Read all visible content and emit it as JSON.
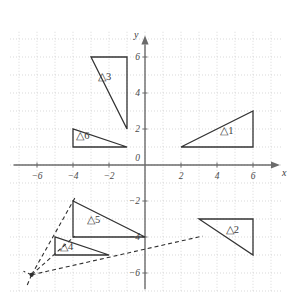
{
  "figure": {
    "background_color": "#ffffff",
    "width": 295,
    "height": 298
  },
  "axes": {
    "x_axis_label": "x",
    "y_axis_label": "y",
    "origin_label": "0",
    "axis_color": "#6b6b6b",
    "grid_color": "#c9c9c9",
    "grid_visible": true,
    "grid_style": "dotted",
    "grid_step": 1,
    "unit_px": 18,
    "origin_px": {
      "x": 145,
      "y": 165
    },
    "xlim": [
      -7.5,
      7.6
    ],
    "ylim": [
      -7.0,
      7.4
    ],
    "x_ticks": [
      {
        "value": -6,
        "label": "−6"
      },
      {
        "value": -4,
        "label": "−4"
      },
      {
        "value": -2,
        "label": "−2"
      },
      {
        "value": 2,
        "label": "2"
      },
      {
        "value": 4,
        "label": "4"
      },
      {
        "value": 6,
        "label": "6"
      }
    ],
    "y_ticks": [
      {
        "value": 6,
        "label": "6"
      },
      {
        "value": 4,
        "label": "4"
      },
      {
        "value": 2,
        "label": "2"
      },
      {
        "value": -2,
        "label": "−2"
      },
      {
        "value": -4,
        "label": "−4"
      },
      {
        "value": -6,
        "label": "−6"
      }
    ]
  },
  "shape_style": {
    "stroke_color": "#333333",
    "stroke_width": 1.3,
    "fill": "none",
    "dashed_stroke_color": "#2f2f2f",
    "dashed_stroke_width": 1.1,
    "dash_pattern": "4,3"
  },
  "triangles": [
    {
      "id": "triangle-1",
      "label": "△1",
      "vertices": [
        [
          2,
          1
        ],
        [
          6,
          1
        ],
        [
          6,
          3
        ]
      ],
      "label_pos": [
        4.55,
        1.75
      ]
    },
    {
      "id": "triangle-2",
      "label": "△2",
      "vertices": [
        [
          3,
          -3
        ],
        [
          6,
          -3
        ],
        [
          6,
          -5
        ]
      ],
      "label_pos": [
        4.85,
        -3.75
      ]
    },
    {
      "id": "triangle-3",
      "label": "△3",
      "vertices": [
        [
          -3,
          6
        ],
        [
          -1,
          6
        ],
        [
          -1,
          2
        ]
      ],
      "label_pos": [
        -2.25,
        4.75
      ]
    },
    {
      "id": "triangle-4",
      "label": "△4",
      "vertices": [
        [
          -5,
          -4
        ],
        [
          -5,
          -5
        ],
        [
          -2,
          -5
        ]
      ],
      "label_pos": [
        -4.35,
        -4.7
      ]
    },
    {
      "id": "triangle-5",
      "label": "△5",
      "vertices": [
        [
          -4,
          -2
        ],
        [
          -4,
          -4
        ],
        [
          0,
          -4
        ]
      ],
      "label_pos": [
        -2.85,
        -3.2
      ]
    },
    {
      "id": "triangle-6",
      "label": "△6",
      "vertices": [
        [
          -4,
          2
        ],
        [
          -4,
          1
        ],
        [
          -1,
          1
        ]
      ],
      "label_pos": [
        -3.45,
        1.45
      ]
    }
  ],
  "projection": {
    "center": [
      -6.3,
      -6.1
    ],
    "center_marker_visible": true,
    "rays": [
      {
        "id": "ray-to-triangle5-apex",
        "from": [
          -6.3,
          -6.1
        ],
        "to": [
          -3.85,
          -1.75
        ]
      },
      {
        "id": "ray-to-triangle5-base",
        "from": [
          -6.3,
          -6.1
        ],
        "to": [
          -3.9,
          -3.95
        ]
      },
      {
        "id": "ray-through-t4-to-t2",
        "from": [
          -6.3,
          -6.1
        ],
        "to": [
          3.2,
          -3.95
        ]
      },
      {
        "id": "ray-lower-left-extension",
        "from": [
          -6.3,
          -6.1
        ],
        "to": [
          -6.6,
          -6.8
        ]
      },
      {
        "id": "ray-upper-left-extension",
        "from": [
          -6.3,
          -6.1
        ],
        "to": [
          -6.75,
          -5.9
        ]
      }
    ]
  }
}
